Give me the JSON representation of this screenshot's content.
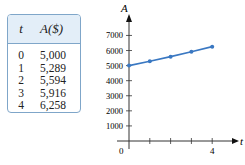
{
  "table": {
    "headers": [
      "t",
      "A($)"
    ],
    "rows": [
      [
        "0",
        "5,000"
      ],
      [
        "1",
        "5,289"
      ],
      [
        "2",
        "5,594"
      ],
      [
        "3",
        "5,916"
      ],
      [
        "4",
        "6,258"
      ]
    ]
  },
  "chart_data": {
    "type": "line",
    "title": "",
    "xlabel": "t",
    "ylabel": "A",
    "x": [
      0,
      1,
      2,
      3,
      4
    ],
    "values": [
      5000,
      5289,
      5594,
      5916,
      6258
    ],
    "y_ticks": [
      "1000",
      "2000",
      "3000",
      "4000",
      "5000",
      "6000",
      "7000"
    ],
    "x_tick_labels": {
      "origin": "0",
      "end": "4"
    },
    "ylim": [
      0,
      7500
    ],
    "xlim": [
      0,
      5
    ],
    "grid": false,
    "line_color": "#3a78c2"
  }
}
